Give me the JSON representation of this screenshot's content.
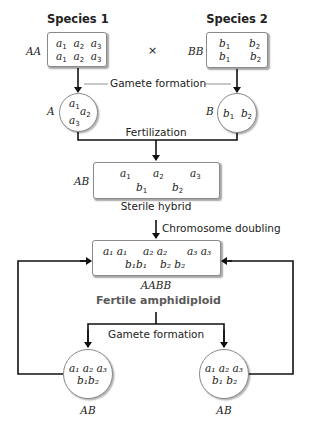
{
  "diagram": {
    "species1": {
      "title": "Species 1",
      "genotype": "AA",
      "rows": [
        [
          {
            "base": "a",
            "sub": "1"
          },
          {
            "base": "a",
            "sub": "2"
          },
          {
            "base": "a",
            "sub": "3"
          }
        ],
        [
          {
            "base": "a",
            "sub": "1"
          },
          {
            "base": "a",
            "sub": "2"
          },
          {
            "base": "a",
            "sub": "3"
          }
        ]
      ]
    },
    "cross_symbol": "×",
    "species2": {
      "title": "Species 2",
      "genotype": "BB",
      "rows": [
        [
          {
            "base": "b",
            "sub": "1"
          },
          {
            "base": "b",
            "sub": "2"
          }
        ],
        [
          {
            "base": "b",
            "sub": "1"
          },
          {
            "base": "b",
            "sub": "2"
          }
        ]
      ]
    },
    "step_gamete_formation_1": "Gamete formation",
    "gamete_a": {
      "label": "A",
      "genes": [
        {
          "base": "a",
          "sub": "1"
        },
        {
          "base": "a",
          "sub": "2"
        },
        {
          "base": "a",
          "sub": "3"
        }
      ]
    },
    "gamete_b": {
      "label": "B",
      "genes": [
        {
          "base": "b",
          "sub": "1"
        },
        {
          "base": "b",
          "sub": "2"
        }
      ]
    },
    "step_fertilization": "Fertilization",
    "hybrid": {
      "genotype": "AB",
      "caption": "Sterile hybrid",
      "top": [
        {
          "base": "a",
          "sub": "1"
        },
        {
          "base": "a",
          "sub": "2"
        },
        {
          "base": "a",
          "sub": "3"
        }
      ],
      "bottom": [
        {
          "base": "b",
          "sub": "1"
        },
        {
          "base": "b",
          "sub": "2"
        }
      ]
    },
    "step_chromosome_doubling": "Chromosome doubling",
    "amphidiploid": {
      "genotype": "AABB",
      "caption": "Fertile amphidiploid",
      "top": [
        "a₁ a₁",
        "a₂ a₂",
        "a₃ a₃"
      ],
      "bottom": [
        "b₁b₁",
        "b₂ b₂"
      ]
    },
    "step_gamete_formation_2": "Gamete formation",
    "offspring_gamete_left": {
      "label": "AB",
      "top": "a₁ a₂ a₃",
      "bottom": "b₁b₂"
    },
    "offspring_gamete_right": {
      "label": "AB",
      "top": "a₁ a₂ a₃",
      "bottom": "b₁ b₂"
    },
    "colors": {
      "line": "#111111",
      "border": "#8a8a8a",
      "caption_fertile": "#5a5a5a"
    }
  }
}
